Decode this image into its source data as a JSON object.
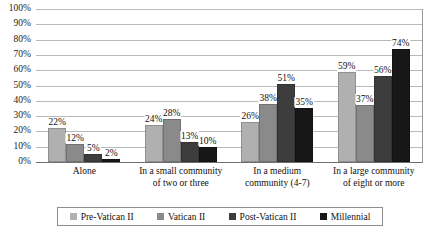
{
  "chart_data": {
    "type": "bar",
    "title": "",
    "subtitle": "",
    "xlabel": "",
    "ylabel": "",
    "ylim": [
      0,
      100
    ],
    "grid": true,
    "legend_position": "bottom",
    "categories": [
      "Alone",
      "In a small community of two or three",
      "In a medium community (4-7)",
      "In a large community of eight or more"
    ],
    "category_lines": [
      [
        "Alone"
      ],
      [
        "In a small community",
        "of two or three"
      ],
      [
        "In a medium",
        "community (4-7)"
      ],
      [
        "In a large community",
        "of eight or more"
      ]
    ],
    "series": [
      {
        "name": "Pre-Vatican II",
        "color": "#b0b0b0",
        "values": [
          22,
          24,
          26,
          59
        ],
        "labels": [
          "22%",
          "24%",
          "26%",
          "59%"
        ]
      },
      {
        "name": "Vatican II",
        "color": "#8a8a8a",
        "values": [
          12,
          28,
          38,
          37
        ],
        "labels": [
          "12%",
          "28%",
          "38%",
          "37%"
        ]
      },
      {
        "name": "Post-Vatican II",
        "color": "#3d3d3d",
        "values": [
          5,
          13,
          51,
          56
        ],
        "labels": [
          "5%",
          "13%",
          "51%",
          "56%"
        ]
      },
      {
        "name": "Millennial",
        "color": "#171717",
        "values": [
          2,
          10,
          35,
          74
        ],
        "labels": [
          "2%",
          "10%",
          "35%",
          "74%"
        ]
      }
    ],
    "y_ticks": [
      "100%",
      "90%",
      "80%",
      "70%",
      "60%",
      "50%",
      "40%",
      "30%",
      "20%",
      "10%",
      "0%"
    ],
    "y_tick_values": [
      100,
      90,
      80,
      70,
      60,
      50,
      40,
      30,
      20,
      10,
      0
    ]
  }
}
